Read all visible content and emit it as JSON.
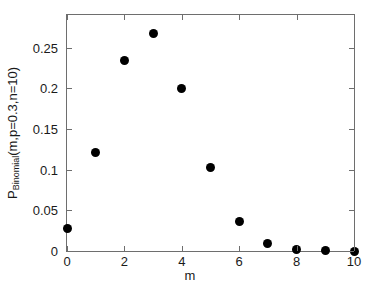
{
  "chart_data": {
    "type": "scatter",
    "title": "",
    "xlabel": "m",
    "ylabel_main": "P",
    "ylabel_sub": "Binomial",
    "ylabel_args": "(m,p=0.3,n=10)",
    "ylabel_full": "P_Binomial(m,p=0.3,n=10)",
    "x": [
      0,
      1,
      2,
      3,
      4,
      5,
      6,
      7,
      8,
      9,
      10
    ],
    "values": [
      0.0282,
      0.1211,
      0.2335,
      0.2668,
      0.2001,
      0.1029,
      0.0368,
      0.009,
      0.0014,
      0.0001,
      0.0
    ],
    "series": [
      {
        "name": "Binomial PMF (p=0.3, n=10)",
        "marker": "filled-circle",
        "color": "#000000",
        "values": [
          0.0282,
          0.1211,
          0.2335,
          0.2668,
          0.2001,
          0.1029,
          0.0368,
          0.009,
          0.0014,
          0.0001,
          0.0
        ]
      }
    ],
    "xlim": [
      0,
      10
    ],
    "ylim": [
      0,
      0.29
    ],
    "xticks": [
      0,
      2,
      4,
      6,
      8,
      10
    ],
    "xticklabels": [
      "0",
      "2",
      "4",
      "6",
      "8",
      "10"
    ],
    "yticks": [
      0,
      0.05,
      0.1,
      0.15,
      0.2,
      0.25
    ],
    "yticklabels": [
      "0",
      "0.05",
      "0.1",
      "0.15",
      "0.2",
      "0.25"
    ],
    "grid": false,
    "legend": null,
    "legend_position": "none",
    "axis_color": "#6e6e6e",
    "background": "#ffffff",
    "point_color": "#000000"
  }
}
